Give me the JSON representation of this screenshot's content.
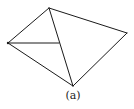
{
  "diagram": {
    "caption": "(a)",
    "stroke_color": "#1a1a1a",
    "vertices": {
      "top": [
        49,
        8
      ],
      "right": [
        127,
        33
      ],
      "left": [
        8,
        43
      ],
      "bottom": [
        73,
        86
      ],
      "inner": [
        59,
        43
      ]
    },
    "edges": [
      [
        "left",
        "top"
      ],
      [
        "top",
        "right"
      ],
      [
        "right",
        "bottom"
      ],
      [
        "bottom",
        "left"
      ],
      [
        "top",
        "bottom"
      ],
      [
        "left",
        "inner"
      ]
    ]
  }
}
